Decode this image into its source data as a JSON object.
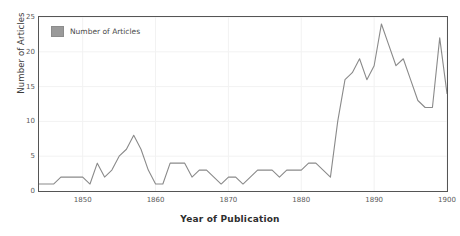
{
  "chart_data": {
    "type": "line",
    "title": "",
    "xlabel": "Year of Publication",
    "ylabel": "Number of Articles",
    "xlim": [
      1844,
      1900
    ],
    "ylim": [
      0,
      25
    ],
    "xticks": [
      "1850",
      "1860",
      "1870",
      "1880",
      "1890",
      "1900"
    ],
    "xtick_values": [
      1850,
      1860,
      1870,
      1880,
      1890,
      1900
    ],
    "yticks": [
      "0",
      "5",
      "10",
      "15",
      "20",
      "25"
    ],
    "ytick_values": [
      0,
      5,
      10,
      15,
      20,
      25
    ],
    "grid": true,
    "legend_position": "top-left",
    "series": [
      {
        "name": "Number of Articles",
        "color": "#8a8a8a",
        "x": [
          1844,
          1845,
          1846,
          1847,
          1848,
          1849,
          1850,
          1851,
          1852,
          1853,
          1854,
          1855,
          1856,
          1857,
          1858,
          1859,
          1860,
          1861,
          1862,
          1863,
          1864,
          1865,
          1866,
          1867,
          1868,
          1869,
          1870,
          1871,
          1872,
          1873,
          1874,
          1875,
          1876,
          1877,
          1878,
          1879,
          1880,
          1881,
          1882,
          1883,
          1884,
          1885,
          1886,
          1887,
          1888,
          1889,
          1890,
          1891,
          1892,
          1893,
          1894,
          1895,
          1896,
          1897,
          1898,
          1899,
          1900
        ],
        "values": [
          1,
          1,
          1,
          2,
          2,
          2,
          2,
          1,
          4,
          2,
          3,
          5,
          6,
          8,
          6,
          3,
          1,
          1,
          4,
          4,
          4,
          2,
          3,
          3,
          2,
          1,
          2,
          2,
          1,
          2,
          3,
          3,
          3,
          2,
          3,
          3,
          3,
          4,
          4,
          3,
          2,
          10,
          16,
          17,
          19,
          16,
          18,
          24,
          21,
          18,
          19,
          16,
          13,
          12,
          12,
          22,
          14
        ]
      }
    ]
  },
  "legend": {
    "entries": [
      {
        "label": "Number of Articles",
        "swatch_color": "#9a9a9a"
      }
    ]
  },
  "axes": {
    "x_title": "Year of Publication",
    "y_title": "Number of Articles"
  },
  "colors": {
    "line": "#8a8a8a",
    "frame": "#555555",
    "grid": "#f2f2f2",
    "tick_text": "#5a5a5a",
    "title_text": "#2e2e2e"
  }
}
